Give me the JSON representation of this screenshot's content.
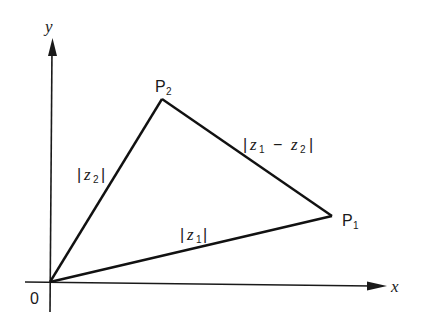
{
  "diagram": {
    "type": "complex-plane-triangle",
    "axes": {
      "x_label": "x",
      "y_label": "y",
      "origin_label": "0"
    },
    "points": {
      "origin": {
        "x": 50,
        "y": 282
      },
      "P1": {
        "label": "P",
        "sub": "1",
        "x": 332,
        "y": 216
      },
      "P2": {
        "label": "P",
        "sub": "2",
        "x": 162,
        "y": 99
      }
    },
    "edges": [
      {
        "from": "origin",
        "to": "P1",
        "label": "|z1|"
      },
      {
        "from": "origin",
        "to": "P2",
        "label": "|z2|"
      },
      {
        "from": "P2",
        "to": "P1",
        "label": "|z1 − z2|"
      }
    ],
    "labels": {
      "z1": {
        "bar": "|",
        "var": "z",
        "sub": "1"
      },
      "z2": {
        "bar": "|",
        "var": "z",
        "sub": "2"
      },
      "diff": {
        "var1": "z",
        "sub1": "1",
        "op": "−",
        "var2": "z",
        "sub2": "2"
      }
    }
  }
}
